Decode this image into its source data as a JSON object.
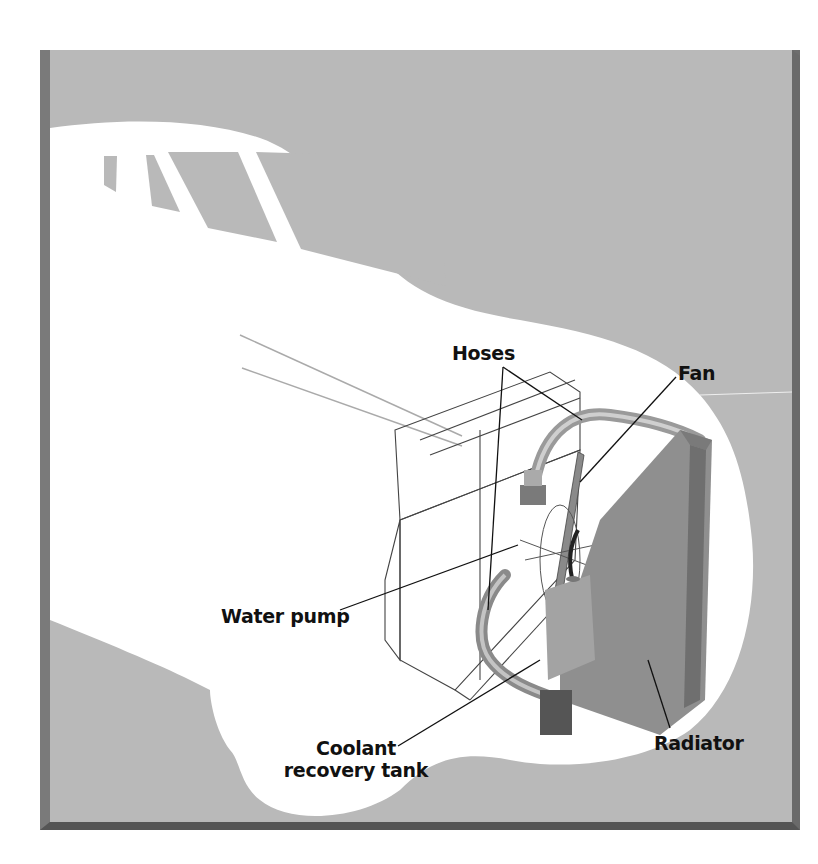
{
  "figure": {
    "colors": {
      "background": "#b9b9b9",
      "car_body": "#ffffff",
      "frame_shadow": "#6e6e6e",
      "radiator": "#8f8f8f",
      "hose": "#a8a8a8",
      "label_text": "#111111"
    }
  },
  "labels": {
    "hoses": "Hoses",
    "fan": "Fan",
    "water_pump": "Water pump",
    "coolant_line1": "Coolant",
    "coolant_line2": "recovery tank",
    "radiator": "Radiator"
  }
}
